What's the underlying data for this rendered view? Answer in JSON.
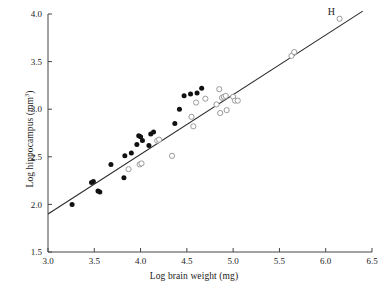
{
  "chart_data": {
    "type": "scatter",
    "title": "",
    "xlabel": "Log brain weight  (mg)",
    "ylabel_prefix": "Log hippocampus (mm",
    "ylabel_sup": "3",
    "ylabel_suffix": ")",
    "xlim": [
      3.0,
      6.5
    ],
    "ylim": [
      1.5,
      4.0
    ],
    "xticks": [
      3.0,
      3.5,
      4.0,
      4.5,
      5.0,
      5.5,
      6.0,
      6.5
    ],
    "xticklabels": [
      "3.0",
      "3.5",
      "4.0",
      "4.5",
      "5.0",
      "5.5",
      "6.0",
      "6.5"
    ],
    "yticks": [
      1.5,
      2.0,
      2.5,
      3.0,
      3.5,
      4.0
    ],
    "yticklabels": [
      "1.5",
      "2.0",
      "2.5",
      "3.0",
      "3.5",
      "4.0"
    ],
    "grid": false,
    "legend": "none",
    "annotations": [
      {
        "text": "H",
        "x": 6.06,
        "y": 3.99
      }
    ],
    "fit_line": {
      "type": "line",
      "x": [
        3.0,
        6.4
      ],
      "y": [
        1.9,
        4.03
      ],
      "color": "#2b2b2b"
    },
    "series": [
      {
        "name": "filled",
        "marker": "filled-circle",
        "color": "#111111",
        "points": [
          [
            3.26,
            2.0
          ],
          [
            3.47,
            2.23
          ],
          [
            3.49,
            2.24
          ],
          [
            3.54,
            2.14
          ],
          [
            3.56,
            2.13
          ],
          [
            3.68,
            2.42
          ],
          [
            3.82,
            2.28
          ],
          [
            3.83,
            2.51
          ],
          [
            3.9,
            2.54
          ],
          [
            3.96,
            2.63
          ],
          [
            3.98,
            2.72
          ],
          [
            4.0,
            2.71
          ],
          [
            4.02,
            2.67
          ],
          [
            4.09,
            2.62
          ],
          [
            4.11,
            2.74
          ],
          [
            4.14,
            2.76
          ],
          [
            4.37,
            2.85
          ],
          [
            4.42,
            3.0
          ],
          [
            4.47,
            3.14
          ],
          [
            4.54,
            3.16
          ],
          [
            4.61,
            3.17
          ],
          [
            4.66,
            3.22
          ]
        ]
      },
      {
        "name": "open",
        "marker": "open-circle",
        "color": "#9a9a9a",
        "points": [
          [
            3.87,
            2.37
          ],
          [
            3.99,
            2.42
          ],
          [
            4.01,
            2.43
          ],
          [
            4.18,
            2.67
          ],
          [
            4.2,
            2.68
          ],
          [
            4.34,
            2.51
          ],
          [
            4.55,
            2.92
          ],
          [
            4.57,
            2.82
          ],
          [
            4.6,
            3.07
          ],
          [
            4.7,
            3.11
          ],
          [
            4.82,
            3.05
          ],
          [
            4.85,
            3.21
          ],
          [
            4.86,
            2.96
          ],
          [
            4.88,
            3.12
          ],
          [
            4.9,
            3.13
          ],
          [
            4.92,
            3.14
          ],
          [
            4.93,
            2.99
          ],
          [
            5.0,
            3.13
          ],
          [
            5.02,
            3.09
          ],
          [
            5.05,
            3.09
          ],
          [
            5.63,
            3.56
          ],
          [
            5.66,
            3.6
          ],
          [
            6.15,
            3.95
          ]
        ]
      }
    ]
  }
}
